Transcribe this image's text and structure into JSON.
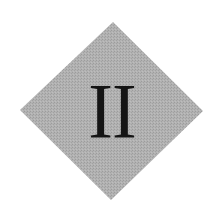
{
  "emblem": {
    "numeral": "II",
    "shape": "diamond",
    "colors": {
      "fill": "#acacac",
      "text": "#141414",
      "background": "#ffffff"
    }
  }
}
